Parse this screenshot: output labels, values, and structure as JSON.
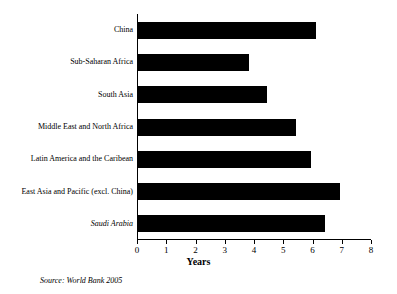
{
  "chart_data": {
    "type": "bar",
    "orientation": "horizontal",
    "title": "",
    "xlabel": "Years",
    "ylabel": "",
    "xlim": [
      0,
      8
    ],
    "xticks": [
      "0",
      "1",
      "2",
      "3",
      "4",
      "5",
      "6",
      "7",
      "8"
    ],
    "grid": false,
    "categories": [
      "China",
      "Sub-Saharan Africa",
      "South Asia",
      "Middle East and North Africa",
      "Latin America and the Caribean",
      "East Asia and Pacific (excl. China)",
      "Saudi Arabia"
    ],
    "values": [
      6.1,
      3.8,
      4.4,
      5.4,
      5.9,
      6.9,
      6.4
    ],
    "italic_categories": [
      "Saudi Arabia"
    ],
    "bar_color": "#000000"
  },
  "footer": {
    "source": "Source: World Bank 2005"
  }
}
